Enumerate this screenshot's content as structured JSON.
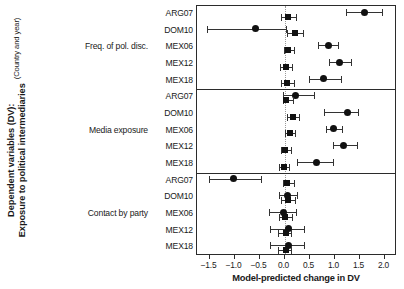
{
  "axis_titles": {
    "y_line1": "Dependent variables (DV):",
    "y_line2": "Exposure to political intermediaries",
    "y_line3": "(Country and year)",
    "x_title": "Model-predicted change in DV"
  },
  "xticks": {
    "labels": [
      "−1.5",
      "−1.0",
      "−0.5",
      "0.0",
      "0.5",
      "1.0",
      "1.5",
      "2.0"
    ],
    "values": [
      -1.5,
      -1.0,
      -0.5,
      0.0,
      0.5,
      1.0,
      1.5,
      2.0
    ]
  },
  "groups": [
    {
      "label": "Freq. of pol. disc."
    },
    {
      "label": "Media exposure"
    },
    {
      "label": "Contact by party"
    }
  ],
  "rows": [
    "ARG07",
    "DOM10",
    "MEX06",
    "MEX12",
    "MEX18",
    "ARG07",
    "DOM10",
    "MEX06",
    "MEX12",
    "MEX18",
    "ARG07",
    "DOM10",
    "MEX06",
    "MEX12",
    "MEX18"
  ],
  "chart_data": {
    "type": "scatter",
    "title": "",
    "xlabel": "Model-predicted change in DV",
    "ylabel": "Dependent variables (DV): Exposure to political intermediaries (Country and year)",
    "xlim": [
      -1.75,
      2.25
    ],
    "xticks": [
      -1.5,
      -1.0,
      -0.5,
      0.0,
      0.5,
      1.0,
      1.5,
      2.0
    ],
    "grid": false,
    "reference_line": 0.0,
    "legend": [],
    "marker_types": [
      "square",
      "circle"
    ],
    "panels": [
      {
        "name": "Freq. of pol. disc.",
        "rows": [
          {
            "label": "ARG07",
            "square": {
              "estimate": 0.06,
              "low": -0.08,
              "high": 0.22
            },
            "circle": {
              "estimate": 1.6,
              "low": 1.22,
              "high": 1.95
            }
          },
          {
            "label": "DOM10",
            "square": {
              "estimate": 0.2,
              "low": 0.04,
              "high": 0.36
            },
            "circle": {
              "estimate": -0.58,
              "low": -1.55,
              "high": 0.02
            }
          },
          {
            "label": "MEX06",
            "square": {
              "estimate": 0.07,
              "low": -0.02,
              "high": 0.18
            },
            "circle": {
              "estimate": 0.88,
              "low": 0.67,
              "high": 1.06
            }
          },
          {
            "label": "MEX12",
            "square": {
              "estimate": 0.02,
              "low": -0.09,
              "high": 0.14
            },
            "circle": {
              "estimate": 1.1,
              "low": 0.89,
              "high": 1.33
            }
          },
          {
            "label": "MEX18",
            "square": {
              "estimate": 0.05,
              "low": -0.07,
              "high": 0.18
            },
            "circle": {
              "estimate": 0.78,
              "low": 0.48,
              "high": 1.12
            }
          }
        ]
      },
      {
        "name": "Media exposure",
        "rows": [
          {
            "label": "ARG07",
            "square": {
              "estimate": 0.03,
              "low": -0.04,
              "high": 0.16
            },
            "circle": {
              "estimate": 0.22,
              "low": -0.03,
              "high": 0.58
            }
          },
          {
            "label": "DOM10",
            "square": {
              "estimate": 0.16,
              "low": 0.04,
              "high": 0.28
            },
            "circle": {
              "estimate": 1.25,
              "low": 0.78,
              "high": 1.46
            }
          },
          {
            "label": "MEX06",
            "square": {
              "estimate": 0.1,
              "low": 0.01,
              "high": 0.2
            },
            "circle": {
              "estimate": 0.98,
              "low": 0.83,
              "high": 1.14
            }
          },
          {
            "label": "MEX12",
            "square": {
              "estimate": 0.01,
              "low": -0.08,
              "high": 0.12
            },
            "circle": {
              "estimate": 1.18,
              "low": 0.96,
              "high": 1.44
            }
          },
          {
            "label": "MEX18",
            "square": {
              "estimate": -0.02,
              "low": -0.11,
              "high": 0.09
            },
            "circle": {
              "estimate": 0.63,
              "low": 0.24,
              "high": 0.97
            }
          }
        ]
      },
      {
        "name": "Contact by party",
        "rows": [
          {
            "label": "ARG07",
            "square": {
              "estimate": 0.05,
              "low": -0.04,
              "high": 0.18
            },
            "circle": {
              "estimate": -1.02,
              "low": -1.52,
              "high": -0.48
            }
          },
          {
            "label": "DOM10",
            "square": {
              "estimate": 0.06,
              "low": -0.08,
              "high": 0.2
            },
            "circle": {
              "estimate": 0.05,
              "low": -0.12,
              "high": 0.25
            }
          },
          {
            "label": "MEX06",
            "square": {
              "estimate": 0.0,
              "low": -0.12,
              "high": 0.14
            },
            "circle": {
              "estimate": -0.02,
              "low": -0.32,
              "high": 0.22
            }
          },
          {
            "label": "MEX12",
            "square": {
              "estimate": 0.02,
              "low": -0.14,
              "high": 0.13
            },
            "circle": {
              "estimate": 0.08,
              "low": -0.3,
              "high": 0.38
            }
          },
          {
            "label": "MEX18",
            "square": {
              "estimate": 0.02,
              "low": -0.14,
              "high": 0.13
            },
            "circle": {
              "estimate": 0.08,
              "low": -0.3,
              "high": 0.38
            }
          }
        ]
      }
    ]
  }
}
